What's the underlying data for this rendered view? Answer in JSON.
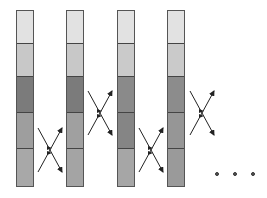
{
  "diagram": {
    "type": "sorting-swap-sequence",
    "columns": [
      {
        "x": 16,
        "segments": [
          "#e2e2e2",
          "#c8c8c8",
          "#7b7b7b",
          "#9e9e9e",
          "#a8a8a8"
        ]
      },
      {
        "x": 66,
        "segments": [
          "#e2e2e2",
          "#c8c8c8",
          "#7b7b7b",
          "#a0a0a0",
          "#a4a4a4"
        ]
      },
      {
        "x": 117,
        "segments": [
          "#e2e2e2",
          "#cacaca",
          "#8a8a8a",
          "#858585",
          "#a6a6a6"
        ]
      },
      {
        "x": 167,
        "segments": [
          "#e2e2e2",
          "#cacaca",
          "#8c8c8c",
          "#969696",
          "#9a9a9a"
        ]
      }
    ],
    "segment_boundaries": [
      10,
      43,
      77,
      113,
      150,
      187
    ],
    "swaps": [
      {
        "between_columns": [
          1,
          2
        ],
        "segments": [
          4,
          5
        ],
        "cx": 50,
        "cy": 150
      },
      {
        "between_columns": [
          2,
          3
        ],
        "segments": [
          3,
          4
        ],
        "cx": 100,
        "cy": 113
      },
      {
        "between_columns": [
          3,
          4
        ],
        "segments": [
          4,
          5
        ],
        "cx": 151,
        "cy": 150
      },
      {
        "between_columns": [
          4,
          5
        ],
        "segments": [
          3,
          4
        ],
        "cx": 202,
        "cy": 113
      }
    ],
    "continuation": "...",
    "colors": {
      "border": "#555555",
      "arrow": "#222222",
      "dot": "#555555"
    }
  }
}
